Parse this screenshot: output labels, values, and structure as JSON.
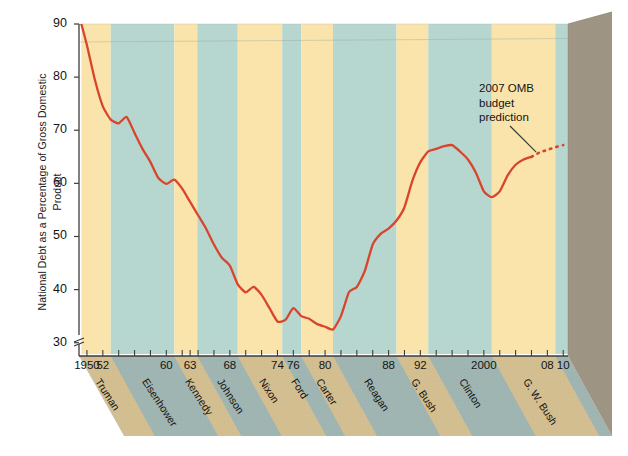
{
  "chart_data": {
    "type": "line",
    "title": "",
    "xlabel": "",
    "ylabel": "National Debt as a Percentage of Gross Domestic Product",
    "xlim": [
      1949,
      2010.6
    ],
    "ylim": [
      27.5,
      90
    ],
    "yticks": [
      30,
      40,
      50,
      60,
      70,
      80,
      90
    ],
    "ytick_labels": [
      "30",
      "40",
      "50",
      "60",
      "70",
      "80",
      "90"
    ],
    "axis_break": true,
    "axis_break_note": "y-axis broken below 30",
    "grid": false,
    "legend": "none",
    "xtick_labels": [
      {
        "year": 1950,
        "label": "1950"
      },
      {
        "year": 1952,
        "label": "52"
      },
      {
        "year": 1960,
        "label": "60"
      },
      {
        "year": 1963,
        "label": "63"
      },
      {
        "year": 1968,
        "label": "68"
      },
      {
        "year": 1974,
        "label": "74"
      },
      {
        "year": 1976,
        "label": "76"
      },
      {
        "year": 1980,
        "label": "80"
      },
      {
        "year": 1988,
        "label": "88"
      },
      {
        "year": 1992,
        "label": "92"
      },
      {
        "year": 2000,
        "label": "2000"
      },
      {
        "year": 2008,
        "label": "08"
      },
      {
        "year": 2010,
        "label": "10"
      }
    ],
    "xtick_years_minor": [
      1950,
      1952,
      1954,
      1956,
      1958,
      1960,
      1962,
      1963,
      1964,
      1966,
      1968,
      1970,
      1972,
      1974,
      1976,
      1978,
      1980,
      1982,
      1984,
      1986,
      1988,
      1990,
      1992,
      1994,
      1996,
      1998,
      2000,
      2002,
      2004,
      2006,
      2008,
      2010
    ],
    "series": [
      {
        "name": "National debt as % of GDP (actual)",
        "style": "solid",
        "color": "#D8452C",
        "x": [
          1949.3,
          1950,
          1951,
          1952,
          1953,
          1954,
          1955,
          1956,
          1957,
          1958,
          1959,
          1960,
          1961,
          1962,
          1963,
          1964,
          1965,
          1966,
          1967,
          1968,
          1969,
          1970,
          1971,
          1972,
          1973,
          1974,
          1975,
          1976,
          1977,
          1978,
          1979,
          1980,
          1981,
          1982,
          1983,
          1984,
          1985,
          1986,
          1987,
          1988,
          1989,
          1990,
          1991,
          1992,
          1993,
          1994,
          1995,
          1996,
          1997,
          1998,
          1999,
          2000,
          2001,
          2002,
          2003,
          2004,
          2005,
          2006
        ],
        "y": [
          90.0,
          86.0,
          79.5,
          74.5,
          72.0,
          71.3,
          72.5,
          69.5,
          66.5,
          64.0,
          61.0,
          59.9,
          60.7,
          59.0,
          56.5,
          54.0,
          51.5,
          48.5,
          46.0,
          44.5,
          41.0,
          39.5,
          40.5,
          39.0,
          36.5,
          34.0,
          34.3,
          36.5,
          35.0,
          34.5,
          33.5,
          33.0,
          32.5,
          35.0,
          39.5,
          40.5,
          43.5,
          48.5,
          50.5,
          51.5,
          53.0,
          55.5,
          60.5,
          64.0,
          66.0,
          66.5,
          67.0,
          67.2,
          66.0,
          64.5,
          62.0,
          58.5,
          57.4,
          58.5,
          61.5,
          63.5,
          64.5,
          65.0
        ]
      },
      {
        "name": "2007 OMB budget prediction",
        "style": "dotted",
        "color": "#D8452C",
        "x": [
          2006,
          2007,
          2008,
          2009,
          2010
        ],
        "y": [
          65.0,
          65.8,
          66.3,
          66.8,
          67.2
        ]
      }
    ],
    "annotations": [
      {
        "name": "omb-prediction-note",
        "lines": [
          "2007 OMB",
          "budget",
          "prediction"
        ],
        "points_to_year": 2006.6,
        "points_to_value": 65.5
      }
    ],
    "president_bands": [
      {
        "name": "Truman",
        "start": 1949.3,
        "end": 1953,
        "color": "yellow"
      },
      {
        "name": "Eisenhower",
        "start": 1953,
        "end": 1961,
        "color": "teal"
      },
      {
        "name": "Kennedy",
        "start": 1961,
        "end": 1963.9,
        "color": "yellow"
      },
      {
        "name": "Johnson",
        "start": 1963.9,
        "end": 1969,
        "color": "teal"
      },
      {
        "name": "Nixon",
        "start": 1969,
        "end": 1974.6,
        "color": "yellow"
      },
      {
        "name": "Ford",
        "start": 1974.6,
        "end": 1977,
        "color": "teal"
      },
      {
        "name": "Carter",
        "start": 1977,
        "end": 1981,
        "color": "yellow"
      },
      {
        "name": "Reagan",
        "start": 1981,
        "end": 1989,
        "color": "teal"
      },
      {
        "name": "G. Bush",
        "start": 1989,
        "end": 1993,
        "color": "yellow"
      },
      {
        "name": "Clinton",
        "start": 1993,
        "end": 2001,
        "color": "teal"
      },
      {
        "name": "G. W. Bush",
        "start": 2001,
        "end": 2009,
        "color": "yellow"
      },
      {
        "name": "",
        "start": 2009,
        "end": 2010.6,
        "color": "teal"
      }
    ]
  },
  "colors": {
    "band_yellow": "#FAE4AB",
    "band_teal": "#B6D7CF",
    "line_red": "#D8452C",
    "side_panel": "#9E9484",
    "floor_yellow": "#D3BE90",
    "floor_teal": "#9FB5B2",
    "axis": "#4d4a44",
    "text": "#141414"
  },
  "ytitle": "National Debt as a Percentage of Gross Domestic Product",
  "annotation": {
    "line1": "2007 OMB",
    "line2": "budget",
    "line3": "prediction"
  }
}
